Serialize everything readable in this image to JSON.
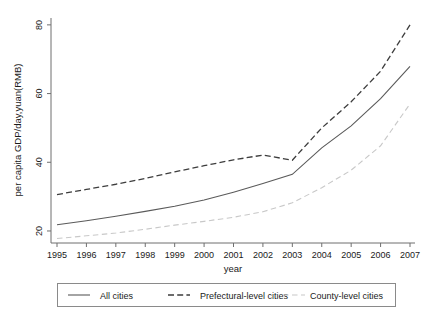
{
  "chart_data": {
    "type": "line",
    "title": "",
    "xlabel": "year",
    "ylabel": "per capita GDP/day,yuan(RMB)",
    "x": [
      1995,
      1996,
      1997,
      1998,
      1999,
      2000,
      2001,
      2002,
      2003,
      2004,
      2005,
      2006,
      2007
    ],
    "xtick_labels": [
      "1995",
      "1996",
      "1997",
      "1998",
      "1999",
      "2000",
      "2001",
      "2002",
      "2003",
      "2004",
      "2005",
      "2006",
      "2007"
    ],
    "ytick_labels": [
      "20",
      "40",
      "60",
      "80"
    ],
    "yticks": [
      20,
      40,
      60,
      80
    ],
    "xlim": [
      1995,
      2007
    ],
    "ylim": [
      16.5,
      82
    ],
    "grid": false,
    "legend_position": "below-axes",
    "series": [
      {
        "name": "All cities",
        "style": "solid",
        "color": "#5a5a5a",
        "values": [
          21.8,
          23.0,
          24.3,
          25.7,
          27.2,
          29.0,
          31.3,
          33.8,
          36.5,
          44.2,
          50.6,
          58.5,
          67.9
        ]
      },
      {
        "name": "Prefectural-level cities",
        "style": "dashed",
        "color": "#3d3d3d",
        "values": [
          30.6,
          32.1,
          33.6,
          35.3,
          37.2,
          39.0,
          40.7,
          42.1,
          40.6,
          50.0,
          57.6,
          66.5,
          80.0
        ]
      },
      {
        "name": "County-level cities",
        "style": "dashed-light",
        "color": "#c8c8c8",
        "values": [
          17.8,
          18.6,
          19.4,
          20.5,
          21.7,
          22.8,
          24.0,
          25.6,
          28.2,
          32.6,
          37.7,
          44.8,
          57.0
        ]
      }
    ]
  },
  "legend": {
    "entries": [
      {
        "label": "All cities"
      },
      {
        "label": "Prefectural-level cities"
      },
      {
        "label": "County-level cities"
      }
    ]
  }
}
